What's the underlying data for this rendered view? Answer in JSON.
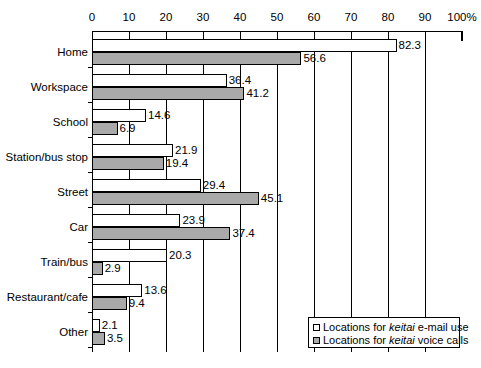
{
  "chart_data": {
    "type": "bar",
    "orientation": "horizontal",
    "title": "",
    "xlabel": "",
    "ylabel": "",
    "xlim": [
      0,
      100
    ],
    "xticks": [
      0,
      10,
      20,
      30,
      40,
      50,
      60,
      70,
      80,
      90,
      100
    ],
    "xtick_labels": [
      "0",
      "10",
      "20",
      "30",
      "40",
      "50",
      "60",
      "70",
      "80",
      "90",
      "100%"
    ],
    "grid": true,
    "grid_axis": "x",
    "legend_position": "bottom-right",
    "categories": [
      "Home",
      "Workspace",
      "School",
      "Station/bus stop",
      "Street",
      "Car",
      "Train/bus",
      "Restaurant/cafe",
      "Other"
    ],
    "series": [
      {
        "name": "Locations for keitai e-mail use",
        "color": "#ffffff",
        "edge_color": "#000000",
        "values": [
          82.3,
          36.4,
          14.6,
          21.9,
          29.4,
          23.9,
          20.3,
          13.6,
          2.1
        ],
        "value_labels": [
          "82.3",
          "36.4",
          "14.6",
          "21.9",
          "29.4",
          "23.9",
          "20.3",
          "13.6",
          "2.1"
        ]
      },
      {
        "name": "Locations for keitai voice calls",
        "color": "#a9a9a9",
        "edge_color": "#000000",
        "values": [
          56.6,
          41.2,
          6.9,
          19.4,
          45.1,
          37.4,
          2.9,
          9.4,
          3.5
        ],
        "value_labels": [
          "56.6",
          "41.2",
          "6.9",
          "19.4",
          "45.1",
          "37.4",
          "2.9",
          "9.4",
          "3.5"
        ]
      }
    ]
  },
  "legend": {
    "items": [
      {
        "prefix": "Locations for ",
        "emphasis": "keitai",
        "suffix": " e-mail use",
        "swatch": "email"
      },
      {
        "prefix": "Locations for ",
        "emphasis": "keitai",
        "suffix": " voice calls",
        "swatch": "voice"
      }
    ]
  }
}
